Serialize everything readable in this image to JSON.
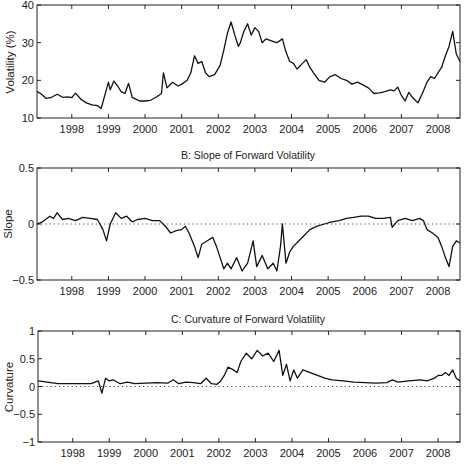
{
  "chart_data": [
    {
      "type": "line",
      "panel": "A",
      "title": "",
      "xlabel": "",
      "ylabel": "Volatility (%)",
      "xlim": [
        1997.05,
        2008.6
      ],
      "ylim": [
        10,
        40
      ],
      "yticks": [
        10,
        20,
        30,
        40
      ],
      "xticks": [
        1998,
        1999,
        2000,
        2001,
        2002,
        2003,
        2004,
        2005,
        2006,
        2007,
        2008
      ],
      "zero_line": false,
      "series": [
        {
          "name": "Volatility",
          "x": [
            1997.05,
            1997.15,
            1997.3,
            1997.45,
            1997.6,
            1997.75,
            1997.9,
            1998.0,
            1998.1,
            1998.25,
            1998.4,
            1998.55,
            1998.7,
            1998.8,
            1998.9,
            1999.0,
            1999.05,
            1999.15,
            1999.25,
            1999.35,
            1999.45,
            1999.55,
            1999.65,
            1999.75,
            1999.85,
            2000.0,
            2000.15,
            2000.3,
            2000.45,
            2000.5,
            2000.6,
            2000.75,
            2000.9,
            2001.0,
            2001.15,
            2001.25,
            2001.35,
            2001.45,
            2001.55,
            2001.65,
            2001.75,
            2001.9,
            2002.05,
            2002.15,
            2002.25,
            2002.35,
            2002.45,
            2002.55,
            2002.6,
            2002.7,
            2002.8,
            2002.9,
            2003.0,
            2003.1,
            2003.2,
            2003.3,
            2003.45,
            2003.6,
            2003.75,
            2003.85,
            2003.95,
            2004.05,
            2004.15,
            2004.3,
            2004.4,
            2004.5,
            2004.6,
            2004.75,
            2004.9,
            2005.05,
            2005.2,
            2005.35,
            2005.5,
            2005.65,
            2005.8,
            2005.95,
            2006.1,
            2006.25,
            2006.4,
            2006.55,
            2006.7,
            2006.8,
            2006.9,
            2007.0,
            2007.1,
            2007.2,
            2007.3,
            2007.45,
            2007.55,
            2007.7,
            2007.8,
            2007.9,
            2008.0,
            2008.1,
            2008.2,
            2008.3,
            2008.4,
            2008.5,
            2008.6
          ],
          "y": [
            17,
            16.5,
            15.2,
            15.5,
            16.3,
            15.5,
            15.6,
            15.4,
            16.6,
            15,
            14,
            13.5,
            13.3,
            12.5,
            16,
            19.5,
            17.5,
            19.8,
            18.5,
            17,
            16.5,
            19.2,
            15.5,
            15,
            14.5,
            14.5,
            14.7,
            15.5,
            16.5,
            22,
            18,
            19.5,
            18.5,
            19,
            20,
            22,
            26.5,
            24.5,
            25,
            22,
            21,
            21.5,
            24,
            28,
            32.5,
            35.5,
            32,
            29,
            30,
            33,
            35,
            32,
            34,
            33,
            30,
            31,
            30.5,
            30,
            31,
            27.5,
            25,
            24.5,
            23,
            24.5,
            25.5,
            23.5,
            22,
            20,
            19.5,
            21,
            21.5,
            20.5,
            20,
            19,
            19.5,
            18.8,
            18,
            16.5,
            16.7,
            17,
            17.5,
            17.2,
            18.2,
            16,
            14.5,
            16.8,
            15.5,
            14,
            16,
            19.5,
            21,
            20.5,
            22,
            23.5,
            26.5,
            29,
            33,
            27,
            25,
            26,
            25.5
          ]
        }
      ]
    },
    {
      "type": "line",
      "panel": "B",
      "title": "B: Slope of Forward Volatility",
      "xlabel": "",
      "ylabel": "Slope",
      "xlim": [
        1997.05,
        2008.6
      ],
      "ylim": [
        -0.5,
        0.5
      ],
      "yticks": [
        -0.5,
        0,
        0.5
      ],
      "xticks": [
        1998,
        1999,
        2000,
        2001,
        2002,
        2003,
        2004,
        2005,
        2006,
        2007,
        2008
      ],
      "zero_line": true,
      "series": [
        {
          "name": "Slope",
          "x": [
            1997.05,
            1997.2,
            1997.4,
            1997.5,
            1997.6,
            1997.75,
            1997.9,
            1998.1,
            1998.3,
            1998.5,
            1998.7,
            1998.85,
            1998.95,
            1999.05,
            1999.2,
            1999.35,
            1999.5,
            1999.65,
            1999.8,
            2000.0,
            2000.2,
            2000.4,
            2000.55,
            2000.7,
            2000.85,
            2001.0,
            2001.1,
            2001.2,
            2001.35,
            2001.45,
            2001.55,
            2001.7,
            2001.85,
            2001.95,
            2002.05,
            2002.15,
            2002.25,
            2002.35,
            2002.5,
            2002.65,
            2002.8,
            2002.95,
            2003.05,
            2003.2,
            2003.35,
            2003.5,
            2003.6,
            2003.7,
            2003.75,
            2003.85,
            2003.95,
            2004.05,
            2004.2,
            2004.35,
            2004.5,
            2004.7,
            2004.9,
            2005.1,
            2005.3,
            2005.5,
            2005.7,
            2005.9,
            2006.1,
            2006.3,
            2006.5,
            2006.7,
            2006.75,
            2006.9,
            2007.1,
            2007.3,
            2007.5,
            2007.6,
            2007.7,
            2007.85,
            2008.0,
            2008.1,
            2008.2,
            2008.3,
            2008.4,
            2008.5,
            2008.6
          ],
          "y": [
            0.0,
            0.02,
            0.07,
            0.05,
            0.1,
            0.04,
            0.05,
            0.03,
            0.06,
            0.05,
            0.04,
            -0.05,
            -0.15,
            0.0,
            0.1,
            0.05,
            0.07,
            0.02,
            0.04,
            0.05,
            0.03,
            0.03,
            -0.02,
            -0.08,
            -0.06,
            -0.05,
            -0.02,
            -0.08,
            -0.2,
            -0.3,
            -0.18,
            -0.15,
            -0.12,
            -0.2,
            -0.3,
            -0.4,
            -0.35,
            -0.4,
            -0.3,
            -0.42,
            -0.35,
            -0.15,
            -0.38,
            -0.28,
            -0.4,
            -0.35,
            -0.42,
            -0.2,
            0.0,
            -0.35,
            -0.25,
            -0.2,
            -0.15,
            -0.1,
            -0.05,
            -0.02,
            0.0,
            0.02,
            0.03,
            0.05,
            0.06,
            0.07,
            0.07,
            0.05,
            0.05,
            0.06,
            -0.03,
            0.03,
            0.05,
            0.03,
            0.05,
            0.03,
            -0.05,
            -0.08,
            -0.12,
            -0.2,
            -0.3,
            -0.38,
            -0.2,
            -0.15,
            -0.17
          ]
        }
      ]
    },
    {
      "type": "line",
      "panel": "C",
      "title": "C: Curvature of Forward Volatility",
      "xlabel": "",
      "ylabel": "Curvature",
      "xlim": [
        1997.05,
        2008.6
      ],
      "ylim": [
        -1,
        1
      ],
      "yticks": [
        -1,
        -0.5,
        0,
        0.5,
        1
      ],
      "xticks": [
        1998,
        1999,
        2000,
        2001,
        2002,
        2003,
        2004,
        2005,
        2006,
        2007,
        2008
      ],
      "zero_line": true,
      "series": [
        {
          "name": "Curvature",
          "x": [
            1997.05,
            1997.3,
            1997.6,
            1997.9,
            1998.2,
            1998.5,
            1998.7,
            1998.8,
            1998.9,
            1999.0,
            1999.1,
            1999.3,
            1999.5,
            1999.7,
            2000.0,
            2000.3,
            2000.6,
            2000.75,
            2000.9,
            2001.1,
            2001.3,
            2001.5,
            2001.65,
            2001.8,
            2001.95,
            2002.05,
            2002.15,
            2002.25,
            2002.4,
            2002.5,
            2002.6,
            2002.75,
            2002.9,
            2003.05,
            2003.2,
            2003.35,
            2003.5,
            2003.65,
            2003.75,
            2003.85,
            2003.95,
            2004.05,
            2004.15,
            2004.3,
            2004.5,
            2004.7,
            2004.9,
            2005.1,
            2005.4,
            2005.7,
            2006.0,
            2006.3,
            2006.6,
            2006.75,
            2006.9,
            2007.2,
            2007.5,
            2007.7,
            2007.9,
            2008.0,
            2008.1,
            2008.2,
            2008.3,
            2008.4,
            2008.5,
            2008.6
          ],
          "y": [
            0.1,
            0.08,
            0.05,
            0.05,
            0.05,
            0.05,
            0.1,
            -0.12,
            0.15,
            0.1,
            0.12,
            0.05,
            0.08,
            0.05,
            0.06,
            0.07,
            0.06,
            0.12,
            0.05,
            0.08,
            0.07,
            0.05,
            0.15,
            0.05,
            0.04,
            0.1,
            0.2,
            0.35,
            0.3,
            0.25,
            0.45,
            0.6,
            0.5,
            0.65,
            0.55,
            0.6,
            0.45,
            0.65,
            0.2,
            0.4,
            0.1,
            0.3,
            0.15,
            0.3,
            0.25,
            0.2,
            0.15,
            0.12,
            0.1,
            0.08,
            0.07,
            0.06,
            0.07,
            0.12,
            0.08,
            0.1,
            0.12,
            0.1,
            0.15,
            0.2,
            0.2,
            0.25,
            0.2,
            0.3,
            0.15,
            0.1
          ]
        }
      ]
    }
  ],
  "panels": {
    "a": {
      "ylabel": "Volatility (%)",
      "yticks": [
        "10",
        "20",
        "30",
        "40"
      ]
    },
    "b": {
      "title": "B: Slope of Forward Volatility",
      "ylabel": "Slope",
      "yticks": [
        "−0.5",
        "0",
        "0.5"
      ]
    },
    "c": {
      "title": "C: Curvature of Forward Volatility",
      "ylabel": "Curvature",
      "yticks": [
        "−1",
        "−0.5",
        "0",
        "0.5",
        "1"
      ]
    }
  },
  "xticks": [
    "1998",
    "1999",
    "2000",
    "2001",
    "2002",
    "2003",
    "2004",
    "2005",
    "2006",
    "2007",
    "2008"
  ]
}
